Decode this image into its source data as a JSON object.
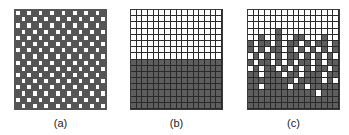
{
  "figure": {
    "panels": [
      {
        "id": "a",
        "label": "(a)",
        "description": "checkerboard configuration",
        "rows": 16,
        "cols": 16,
        "pattern": "checkerboard"
      },
      {
        "id": "b",
        "label": "(b)",
        "description": "phase-separated configuration: top half white, bottom half dark",
        "rows": 16,
        "cols": 16,
        "pattern": "split"
      },
      {
        "id": "c",
        "label": "(c)",
        "description": "partially mixed configuration",
        "rows": 16,
        "cols": 16,
        "pattern": "custom",
        "cells": [
          "WWWWWWWWWWWWWWWW",
          "WWWWWWWWWWWWWWWW",
          "WWWWWWWWWWWWWWWW",
          "WWWWWDWWWWWWWWWW",
          "WWDWWDWWDDWWWDWW",
          "DWDDWDWDDWDWDDWD",
          "DWDWDDWDWDWDWDWD",
          "WDWDWDWDDWDWDWDW",
          "DWDDWDWDWDDWDWDD",
          "WDWDDWDWDWDWDDWD",
          "DDWDDDWDDWDDDWDD",
          "DDDDDDDDWDDDDWDW",
          "DDWDDDDWDDWDDDDD",
          "DDDDDDDDDDDDWDDD",
          "DDDDDDDDDDDDDDDD",
          "DDDDDDDDDDDDDDDD"
        ]
      }
    ],
    "colors": {
      "white_cell": "#ffffff",
      "dark_cell": "#5e5e5e",
      "grid_line": "#2a2a2a",
      "label_text": "#222222"
    }
  }
}
